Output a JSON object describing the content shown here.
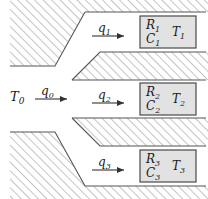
{
  "figure": {
    "type": "thermal-flow-network-diagram",
    "inlet": {
      "temperature_label": "T",
      "temperature_sub": "0",
      "flow_label": "q",
      "flow_sub": "0"
    },
    "branches": [
      {
        "flow_label": "q",
        "flow_sub": "1",
        "resistance_label": "R",
        "resistance_sub": "1",
        "capacitance_label": "C",
        "capacitance_sub": "1",
        "temperature_label": "T",
        "temperature_sub": "1"
      },
      {
        "flow_label": "q",
        "flow_sub": "2",
        "resistance_label": "R",
        "resistance_sub": "2",
        "capacitance_label": "C",
        "capacitance_sub": "2",
        "temperature_label": "T",
        "temperature_sub": "2"
      },
      {
        "flow_label": "q",
        "flow_sub": "3",
        "resistance_label": "R",
        "resistance_sub": "3",
        "capacitance_label": "C",
        "capacitance_sub": "3",
        "temperature_label": "T",
        "temperature_sub": "3"
      }
    ]
  },
  "colors": {
    "line": "#555555",
    "hatch": "#8a8a8a",
    "block_fill": "#e2e2e2",
    "block_border": "#4a4a4a",
    "text": "#1a1a1a",
    "background": "#ffffff"
  }
}
